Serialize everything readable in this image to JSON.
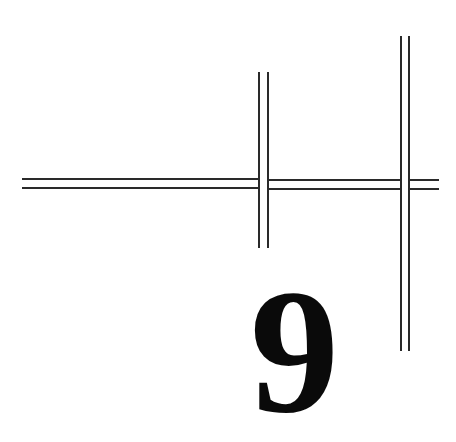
{
  "figure": {
    "digit": "9",
    "line_color": "#2a2a2a",
    "digit_color": "#0a0a0a",
    "background": "#ffffff"
  }
}
